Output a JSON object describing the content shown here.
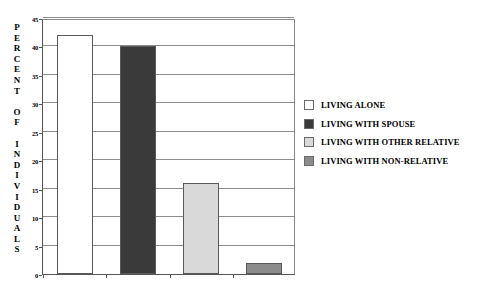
{
  "chart_data": {
    "type": "bar",
    "title": "",
    "subtitle": "",
    "xlabel": "",
    "ylabel": "PERCENT OF INDIVIDUALS",
    "ylim": [
      0,
      45
    ],
    "ytick_values": [
      0,
      5,
      10,
      15,
      20,
      25,
      30,
      35,
      40,
      45
    ],
    "ytick_labels": [
      "0",
      "5",
      "10",
      "15",
      "20",
      "25",
      "30",
      "35",
      "40",
      "45"
    ],
    "xtick_labels": [],
    "grid": "horizontal",
    "legend_position": "right",
    "categories": [
      "LIVING ALONE",
      "LIVING WITH SPOUSE",
      "LIVING WITH OTHER RELATIVE",
      "LIVING WITH NON-RELATIVE"
    ],
    "values": [
      42,
      40,
      16,
      2
    ],
    "colors": [
      "#ffffff",
      "#3a3a3a",
      "#d9d9d9",
      "#8c8c8c"
    ],
    "series": [
      {
        "name": "PERCENT OF INDIVIDUALS",
        "values": [
          42,
          40,
          16,
          2
        ]
      }
    ]
  },
  "ylabel_chars": [
    "P",
    "E",
    "R",
    "C",
    "E",
    "N",
    "T",
    "",
    "O",
    "F",
    "",
    "I",
    "N",
    "D",
    "I",
    "V",
    "I",
    "D",
    "U",
    "A",
    "L",
    "S"
  ],
  "legend": {
    "items": [
      {
        "label": "LIVING ALONE",
        "color": "#ffffff"
      },
      {
        "label": "LIVING WITH SPOUSE",
        "color": "#3a3a3a"
      },
      {
        "label": "LIVING WITH OTHER RELATIVE",
        "color": "#d9d9d9"
      },
      {
        "label": "LIVING WITH NON-RELATIVE",
        "color": "#8c8c8c"
      }
    ]
  },
  "axis": {
    "frame_color": "#555555",
    "grid_color": "#8c8c8c"
  }
}
